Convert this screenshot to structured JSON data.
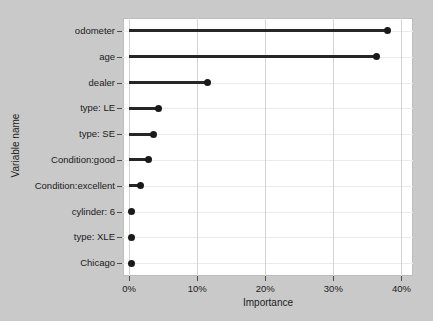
{
  "chart_data": {
    "type": "bar",
    "subtype": "lollipop-horizontal",
    "title": "",
    "xlabel": "Importance",
    "ylabel": "Variable name",
    "categories": [
      "odometer",
      "age",
      "dealer",
      "type: LE",
      "type: SE",
      "Condition:good",
      "Condition:excellent",
      "cylinder: 6",
      "type: XLE",
      "Chicago"
    ],
    "values": [
      38.0,
      36.4,
      11.5,
      4.3,
      3.6,
      2.8,
      1.7,
      0.3,
      0.3,
      0.3
    ],
    "value_unit": "percent",
    "xlim": [
      -0.9,
      41.7
    ],
    "ylim_categories_order": "descending-importance",
    "xticks": [
      0,
      10,
      20,
      30,
      40
    ],
    "xtick_labels": [
      "0%",
      "10%",
      "20%",
      "30%",
      "40%"
    ],
    "grid": {
      "vertical": true,
      "horizontal": true
    },
    "legend": null,
    "colors": {
      "point": "#1a1a1a",
      "stem": "#262626",
      "panel_background": "#ffffff",
      "figure_background": "#c9c9c9",
      "gridline_major": "#d4d4d4",
      "gridline_minor": "#ebebeb",
      "axis_text": "#1a1a1a"
    }
  },
  "axes": {
    "x_title": "Importance",
    "y_title": "Variable name"
  }
}
